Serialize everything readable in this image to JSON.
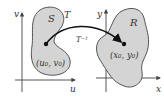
{
  "figure": {
    "left_panel": {
      "x_axis_label": "u",
      "y_axis_label": "v",
      "region_label": "S",
      "point_label": "(u₀, v₀)"
    },
    "right_panel": {
      "x_axis_label": "x",
      "y_axis_label": "y",
      "region_label": "R",
      "point_label": "(x₀, y₀)"
    },
    "mapping": {
      "forward_label": "T",
      "inverse_label": "T⁻¹"
    },
    "colors": {
      "region_fill": "#d4d4d4",
      "region_stroke": "#555555",
      "axis": "#444444",
      "arrow": "#111111"
    }
  }
}
